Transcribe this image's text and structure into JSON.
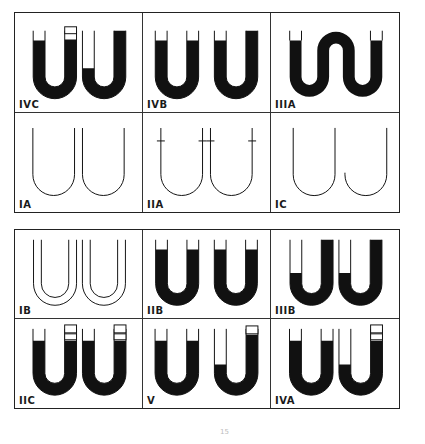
{
  "figure": {
    "panels_top": [
      {
        "id": "IVC",
        "label": "IVC"
      },
      {
        "id": "IVB",
        "label": "IVB"
      },
      {
        "id": "IIIA",
        "label": "IIIA"
      },
      {
        "id": "IA",
        "label": "IA"
      },
      {
        "id": "IIA",
        "label": "IIA"
      },
      {
        "id": "IC",
        "label": "IC"
      }
    ],
    "panels_bottom": [
      {
        "id": "IB",
        "label": "IB"
      },
      {
        "id": "IIB",
        "label": "IIB"
      },
      {
        "id": "IIIB",
        "label": "IIIB"
      },
      {
        "id": "IIC",
        "label": "IIC"
      },
      {
        "id": "V",
        "label": "V"
      },
      {
        "id": "IVA",
        "label": "IVA"
      }
    ],
    "caption": "15",
    "colors": {
      "ink": "#111111",
      "border": "#222222",
      "background": "#ffffff"
    }
  }
}
